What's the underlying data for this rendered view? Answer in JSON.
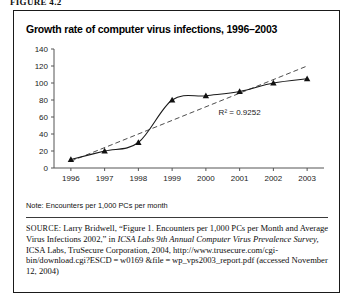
{
  "figure": {
    "label": "FIGURE 4.2"
  },
  "chart_data": {
    "type": "line",
    "title": "Growth rate of computer virus infections, 1996–2003",
    "categories": [
      "1996",
      "1997",
      "1998",
      "1999",
      "2000",
      "2001",
      "2002",
      "2003"
    ],
    "xlabel": "",
    "ylabel": "",
    "ylim": [
      0,
      140
    ],
    "yticks": [
      0,
      20,
      40,
      60,
      80,
      100,
      120,
      140
    ],
    "grid": false,
    "legend_position": "none",
    "series": [
      {
        "name": "Encounters per 1,000 PCs per month",
        "style": "solid-line-with-triangle-markers",
        "color": "#1a1a1a",
        "values": [
          10,
          20,
          30,
          80,
          85,
          90,
          100,
          105
        ]
      },
      {
        "name": "Linear trendline",
        "style": "dashed-line",
        "color": "#4d4d4d",
        "values": [
          8,
          24,
          40,
          56,
          72,
          88,
          104,
          120
        ]
      }
    ],
    "annotations": [
      {
        "name": "r-squared",
        "text": "R² = 0.9252",
        "x": "2001",
        "y": 62
      }
    ]
  },
  "note": {
    "text": "Note: Encounters per 1,000 PCs per month"
  },
  "source": {
    "label": "SOURCE:",
    "line1": " Larry Bridwell, “Figure 1. Encounters per 1,000 PCs per Month",
    "line2": "and Average Virus Infections 2002,” in ",
    "italic1": "ICSA Labs 9th Annual",
    "italic2": "Computer Virus Prevalence Survey,",
    "line3": " ICSA Labs, TruSecure Corporation,",
    "line4": "2004, http://www.trusecure.com/cgi-bin/download.cgi?ESCD = w0169",
    "line5": "&file = wp_vps2003_report.pdf (accessed November 12, 2004)"
  }
}
